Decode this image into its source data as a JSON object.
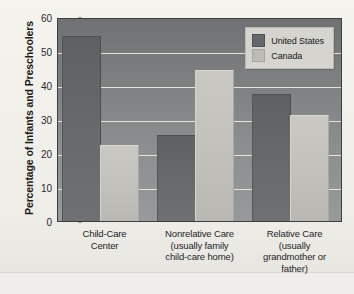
{
  "chart_data": {
    "type": "bar",
    "title": "",
    "subtitle": "",
    "xlabel": "",
    "ylabel": "Percentage of Infants and Preschoolers",
    "ylim": [
      0,
      60
    ],
    "ytick_step": 10,
    "yticks": [
      "60",
      "50",
      "40",
      "30",
      "20",
      "10",
      "0"
    ],
    "grid": true,
    "legend_position": "top-right-inside",
    "categories": [
      "Child-Care Center",
      "Nonrelative Care (usually family child-care home)",
      "Relative Care (usually grandmother or father)"
    ],
    "category_label_lines": [
      [
        "Child-Care",
        "Center"
      ],
      [
        "Nonrelative Care",
        "(usually family",
        "child-care home)"
      ],
      [
        "Relative Care",
        "(usually",
        "grandmother or",
        "father)"
      ]
    ],
    "series": [
      {
        "name": "United States",
        "color": "#65676a",
        "values": [
          54,
          25,
          37
        ]
      },
      {
        "name": "Canada",
        "color": "#bcbbb6",
        "values": [
          22,
          44,
          31
        ]
      }
    ]
  },
  "legend": {
    "items": [
      {
        "label": "United States",
        "swatch": "us"
      },
      {
        "label": "Canada",
        "swatch": "ca"
      }
    ]
  },
  "colors": {
    "plot_background": "#8b8d8e",
    "gridline": "#eceae4",
    "page_background": "#f3f1ec",
    "axis_border": "#3d3f40",
    "series_united_states": "#65676a",
    "series_canada": "#bcbbb6"
  }
}
